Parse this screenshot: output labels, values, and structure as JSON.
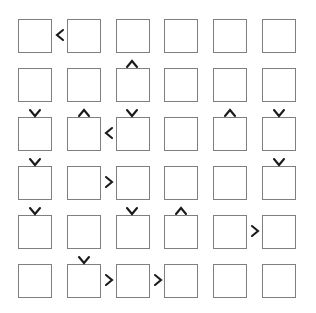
{
  "diagram": {
    "type": "grid-node-diagram",
    "canvas": {
      "width": 316,
      "height": 313,
      "background": "#ffffff"
    },
    "node": {
      "size": 34,
      "fill": "#ffffff",
      "stroke": "#7f7f7f",
      "stroke_width": 1,
      "label": ""
    },
    "grid": {
      "rows": 6,
      "cols": 6,
      "col_x": [
        18,
        67,
        116,
        164,
        213,
        262
      ],
      "row_y": [
        19,
        68,
        117,
        166,
        215,
        264
      ],
      "col_pitch": 49,
      "row_pitch": 49
    },
    "arrow_style": {
      "color": "#1a1a1a",
      "glyph_left": "‹",
      "glyph_right": "›",
      "glyph_up": "^",
      "glyph_down": "v"
    },
    "nodes": [
      {
        "id": "r1c1",
        "row": 1,
        "col": 1,
        "label": ""
      },
      {
        "id": "r1c2",
        "row": 1,
        "col": 2,
        "label": ""
      },
      {
        "id": "r1c3",
        "row": 1,
        "col": 3,
        "label": ""
      },
      {
        "id": "r1c4",
        "row": 1,
        "col": 4,
        "label": ""
      },
      {
        "id": "r1c5",
        "row": 1,
        "col": 5,
        "label": ""
      },
      {
        "id": "r1c6",
        "row": 1,
        "col": 6,
        "label": ""
      },
      {
        "id": "r2c1",
        "row": 2,
        "col": 1,
        "label": ""
      },
      {
        "id": "r2c2",
        "row": 2,
        "col": 2,
        "label": ""
      },
      {
        "id": "r2c3",
        "row": 2,
        "col": 3,
        "label": ""
      },
      {
        "id": "r2c4",
        "row": 2,
        "col": 4,
        "label": ""
      },
      {
        "id": "r2c5",
        "row": 2,
        "col": 5,
        "label": ""
      },
      {
        "id": "r2c6",
        "row": 2,
        "col": 6,
        "label": ""
      },
      {
        "id": "r3c1",
        "row": 3,
        "col": 1,
        "label": ""
      },
      {
        "id": "r3c2",
        "row": 3,
        "col": 2,
        "label": ""
      },
      {
        "id": "r3c3",
        "row": 3,
        "col": 3,
        "label": ""
      },
      {
        "id": "r3c4",
        "row": 3,
        "col": 4,
        "label": ""
      },
      {
        "id": "r3c5",
        "row": 3,
        "col": 5,
        "label": ""
      },
      {
        "id": "r3c6",
        "row": 3,
        "col": 6,
        "label": ""
      },
      {
        "id": "r4c1",
        "row": 4,
        "col": 1,
        "label": ""
      },
      {
        "id": "r4c2",
        "row": 4,
        "col": 2,
        "label": ""
      },
      {
        "id": "r4c3",
        "row": 4,
        "col": 3,
        "label": ""
      },
      {
        "id": "r4c4",
        "row": 4,
        "col": 4,
        "label": ""
      },
      {
        "id": "r4c5",
        "row": 4,
        "col": 5,
        "label": ""
      },
      {
        "id": "r4c6",
        "row": 4,
        "col": 6,
        "label": ""
      },
      {
        "id": "r5c1",
        "row": 5,
        "col": 1,
        "label": ""
      },
      {
        "id": "r5c2",
        "row": 5,
        "col": 2,
        "label": ""
      },
      {
        "id": "r5c3",
        "row": 5,
        "col": 3,
        "label": ""
      },
      {
        "id": "r5c4",
        "row": 5,
        "col": 4,
        "label": ""
      },
      {
        "id": "r5c5",
        "row": 5,
        "col": 5,
        "label": ""
      },
      {
        "id": "r5c6",
        "row": 5,
        "col": 6,
        "label": ""
      },
      {
        "id": "r6c1",
        "row": 6,
        "col": 1,
        "label": ""
      },
      {
        "id": "r6c2",
        "row": 6,
        "col": 2,
        "label": ""
      },
      {
        "id": "r6c3",
        "row": 6,
        "col": 3,
        "label": ""
      },
      {
        "id": "r6c4",
        "row": 6,
        "col": 4,
        "label": ""
      },
      {
        "id": "r6c5",
        "row": 6,
        "col": 5,
        "label": ""
      },
      {
        "id": "r6c6",
        "row": 6,
        "col": 6,
        "label": ""
      }
    ],
    "arrows": [
      {
        "id": "a01",
        "direction": "left",
        "x": 53,
        "y": 28,
        "between": "r1c2 -> r1c1"
      },
      {
        "id": "a02",
        "direction": "up",
        "x": 125,
        "y": 57,
        "between": "r2c3 -> r1c3"
      },
      {
        "id": "a03",
        "direction": "down",
        "x": 28,
        "y": 106,
        "between": "r2c1 -> r3c1"
      },
      {
        "id": "a04",
        "direction": "up",
        "x": 77,
        "y": 106,
        "between": "r3c2 -> r2c2"
      },
      {
        "id": "a05",
        "direction": "down",
        "x": 125,
        "y": 106,
        "between": "r2c3 -> r3c3"
      },
      {
        "id": "a06",
        "direction": "up",
        "x": 223,
        "y": 106,
        "between": "r3c5 -> r2c5"
      },
      {
        "id": "a07",
        "direction": "down",
        "x": 272,
        "y": 106,
        "between": "r2c6 -> r3c6"
      },
      {
        "id": "a08",
        "direction": "left",
        "x": 102,
        "y": 126,
        "between": "r3c3 -> r3c2"
      },
      {
        "id": "a09",
        "direction": "down",
        "x": 28,
        "y": 155,
        "between": "r3c1 -> r4c1"
      },
      {
        "id": "a10",
        "direction": "down",
        "x": 272,
        "y": 155,
        "between": "r3c6 -> r4c6"
      },
      {
        "id": "a11",
        "direction": "right",
        "x": 102,
        "y": 175,
        "between": "r4c2 -> r4c3"
      },
      {
        "id": "a12",
        "direction": "down",
        "x": 28,
        "y": 204,
        "between": "r4c1 -> r5c1"
      },
      {
        "id": "a13",
        "direction": "down",
        "x": 125,
        "y": 204,
        "between": "r4c3 -> r5c3"
      },
      {
        "id": "a14",
        "direction": "up",
        "x": 174,
        "y": 204,
        "between": "r5c4 -> r4c4"
      },
      {
        "id": "a15",
        "direction": "right",
        "x": 248,
        "y": 224,
        "between": "r5c5 -> r5c6"
      },
      {
        "id": "a16",
        "direction": "down",
        "x": 77,
        "y": 253,
        "between": "r5c2 -> r6c2"
      },
      {
        "id": "a17",
        "direction": "right",
        "x": 102,
        "y": 273,
        "between": "r6c2 -> r6c3"
      },
      {
        "id": "a18",
        "direction": "right",
        "x": 151,
        "y": 273,
        "between": "r6c3 -> r6c4"
      }
    ]
  }
}
